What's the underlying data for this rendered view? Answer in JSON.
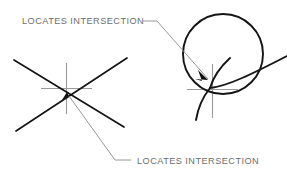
{
  "figure": {
    "background_color": "#ffffff",
    "geometry_color": "#1a1a1a",
    "marker_color": "#9a9a9a",
    "leader_color": "#8c8c8c",
    "text_color": "#6e6e6e"
  },
  "annotations": {
    "top_label": "LOCATES  INTERSECTION",
    "bottom_label": "LOCATES  INTERSECTION"
  },
  "diagrams": [
    {
      "id": "crossing-lines",
      "name": "two-crossing-lines",
      "description": "Two straight lines crossing at a point with a crosshair snap marker",
      "intersection_point": {
        "x": 66,
        "y": 88
      },
      "elements": [
        {
          "type": "line",
          "x1": 14,
          "y1": 60,
          "x2": 124,
          "y2": 127
        },
        {
          "type": "line",
          "x1": 16,
          "y1": 131,
          "x2": 127,
          "y2": 58
        },
        {
          "type": "crosshair",
          "cx": 66,
          "cy": 88,
          "arm": 25
        }
      ]
    },
    {
      "id": "circle-and-arc",
      "name": "circle-and-arc",
      "description": "A circle crossed by an arc with a crosshair snap marker at the intersection",
      "intersection_point": {
        "x": 212,
        "y": 86
      },
      "elements": [
        {
          "type": "circle",
          "cx": 223,
          "cy": 54,
          "r": 40
        },
        {
          "type": "arc",
          "description": "arc sweeping from lower-left up to the right past the circle"
        },
        {
          "type": "arc",
          "description": "steep arc descending to lower-left tail"
        },
        {
          "type": "crosshair",
          "cx": 212,
          "cy": 86,
          "arm": 25
        }
      ]
    }
  ],
  "leaders": [
    {
      "id": "top-leader",
      "name": "leader-to-circle-intersection",
      "from_label": "top_label",
      "arrow_target": {
        "x": 207,
        "y": 81
      },
      "arrow": true
    },
    {
      "id": "bottom-leader",
      "name": "leader-to-lines-intersection",
      "from_label": "bottom_label",
      "arrow_target": {
        "x": 66,
        "y": 92
      },
      "arrow": true
    }
  ]
}
